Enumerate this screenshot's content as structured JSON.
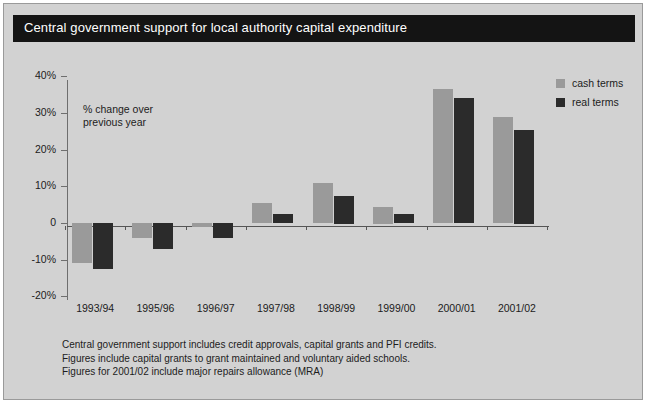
{
  "figure": {
    "title": "Central government support for local authority capital expenditure",
    "annotation_line1": "% change over",
    "annotation_line2": "previous year",
    "background_color": "#d2d2d2",
    "title_bar_color": "#141414",
    "cash_color": "#9a9a9a",
    "real_color": "#2b2b2b"
  },
  "legend": {
    "items": [
      {
        "label": "cash terms",
        "color": "#9a9a9a"
      },
      {
        "label": "real terms",
        "color": "#2b2b2b"
      }
    ]
  },
  "footnotes": [
    "Central government support includes credit approvals, capital grants and PFI credits.",
    "Figures include capital grants to grant maintained and voluntary aided schools.",
    "Figures for 2001/02 include major repairs allowance (MRA)"
  ],
  "chart_data": {
    "type": "bar",
    "title": "Central government support for local authority capital expenditure",
    "xlabel": "",
    "ylabel": "% change over previous year",
    "ylim": [
      -20,
      40
    ],
    "ytick_labels": [
      "40%",
      "30%",
      "20%",
      "10%",
      "0",
      "-10%",
      "-20%"
    ],
    "ytick_values": [
      40,
      30,
      20,
      10,
      0,
      -10,
      -20
    ],
    "grid": false,
    "legend_position": "top-right",
    "categories": [
      "1993/94",
      "1995/96",
      "1996/97",
      "1997/98",
      "1998/99",
      "1999/00",
      "2000/01",
      "2001/02"
    ],
    "series": [
      {
        "name": "cash terms",
        "color": "#9a9a9a",
        "values": [
          -11,
          -4,
          -1,
          5.5,
          11,
          4.5,
          36.5,
          29
        ]
      },
      {
        "name": "real terms",
        "color": "#2b2b2b",
        "values": [
          -12.5,
          -7,
          -4,
          2.5,
          7.5,
          2.5,
          34,
          25.5
        ]
      }
    ]
  }
}
